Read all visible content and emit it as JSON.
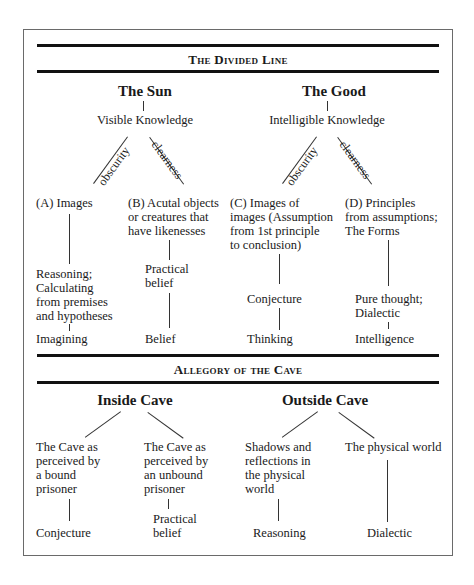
{
  "divided_line": {
    "title": "The Divided Line",
    "left": {
      "heading": "The Sun",
      "subheading": "Visible Knowledge",
      "branch_left_label": "obscurity",
      "branch_right_label": "clearness",
      "col_a": {
        "label": "(A) Images",
        "middle": [
          "Reasoning;",
          "Calculating",
          "from premises",
          "and hypotheses"
        ],
        "bottom": "Imagining"
      },
      "col_b": {
        "label": [
          "(B) Acutal objects",
          "or creatures that",
          "have likenesses"
        ],
        "middle": [
          "Practical",
          "belief"
        ],
        "bottom": "Belief"
      }
    },
    "right": {
      "heading": "The Good",
      "subheading": "Intelligible Knowledge",
      "branch_left_label": "obscurity",
      "branch_right_label": "clearness",
      "col_c": {
        "label": [
          "(C) Images of",
          "images (Assumption",
          "from 1st principle",
          "to conclusion)"
        ],
        "middle": "Conjecture",
        "bottom": "Thinking"
      },
      "col_d": {
        "label": [
          "(D) Principles",
          "from assumptions;",
          "The Forms"
        ],
        "middle": [
          "Pure thought;",
          "Dialectic"
        ],
        "bottom": "Intelligence"
      }
    }
  },
  "cave": {
    "title": "Allegory of the Cave",
    "inside": {
      "heading": "Inside Cave",
      "left": {
        "label": [
          "The Cave as",
          "perceived by",
          "a bound",
          "prisoner"
        ],
        "bottom": "Conjecture"
      },
      "right": {
        "label": [
          "The Cave as",
          "perceived by",
          "an unbound",
          "prisoner"
        ],
        "bottom": [
          "Practical",
          "belief"
        ]
      }
    },
    "outside": {
      "heading": "Outside Cave",
      "left": {
        "label": [
          "Shadows and",
          "reflections in",
          "the physical",
          "world"
        ],
        "bottom": "Reasoning"
      },
      "right": {
        "label": [
          "The physical world"
        ],
        "bottom": "Dialectic"
      }
    }
  }
}
